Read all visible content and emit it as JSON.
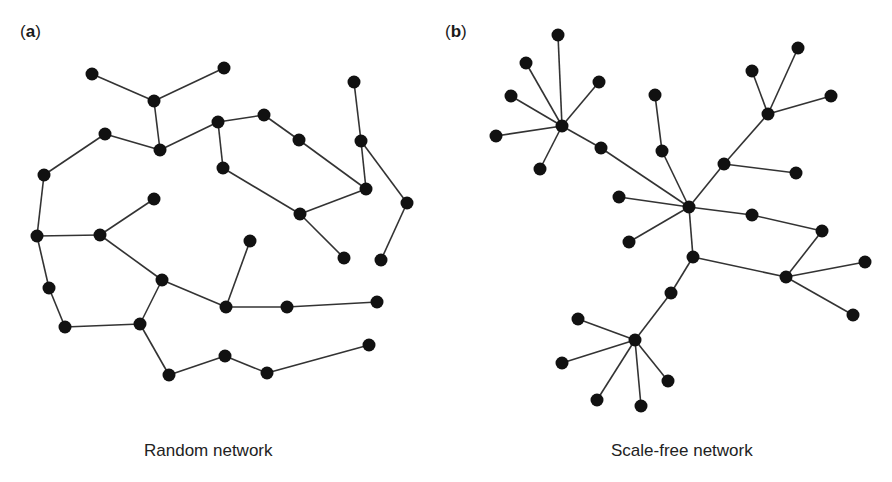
{
  "panels": [
    {
      "id": "a",
      "label_open": "(",
      "label_letter": "a",
      "label_close": ")",
      "caption": "Random network",
      "node_radius": 6.5,
      "nodes": [
        [
          92,
          74
        ],
        [
          154,
          101
        ],
        [
          224,
          68
        ],
        [
          160,
          150
        ],
        [
          105,
          134
        ],
        [
          44,
          175
        ],
        [
          37,
          236
        ],
        [
          100,
          235
        ],
        [
          154,
          199
        ],
        [
          218,
          122
        ],
        [
          264,
          115
        ],
        [
          299,
          140
        ],
        [
          223,
          168
        ],
        [
          354,
          82
        ],
        [
          361,
          141
        ],
        [
          366,
          189
        ],
        [
          407,
          203
        ],
        [
          300,
          214
        ],
        [
          344,
          258
        ],
        [
          381,
          260
        ],
        [
          250,
          241
        ],
        [
          162,
          280
        ],
        [
          226,
          307
        ],
        [
          287,
          307
        ],
        [
          377,
          302
        ],
        [
          49,
          288
        ],
        [
          65,
          327
        ],
        [
          140,
          324
        ],
        [
          169,
          375
        ],
        [
          225,
          356
        ],
        [
          267,
          373
        ],
        [
          369,
          345
        ]
      ],
      "edges": [
        [
          0,
          1
        ],
        [
          1,
          2
        ],
        [
          1,
          3
        ],
        [
          4,
          3
        ],
        [
          3,
          9
        ],
        [
          4,
          5
        ],
        [
          5,
          6
        ],
        [
          6,
          7
        ],
        [
          7,
          8
        ],
        [
          7,
          21
        ],
        [
          9,
          10
        ],
        [
          10,
          11
        ],
        [
          11,
          15
        ],
        [
          9,
          12
        ],
        [
          12,
          17
        ],
        [
          17,
          15
        ],
        [
          17,
          18
        ],
        [
          13,
          14
        ],
        [
          14,
          15
        ],
        [
          14,
          16
        ],
        [
          16,
          19
        ],
        [
          20,
          22
        ],
        [
          21,
          22
        ],
        [
          22,
          23
        ],
        [
          23,
          24
        ],
        [
          6,
          25
        ],
        [
          25,
          26
        ],
        [
          26,
          27
        ],
        [
          27,
          21
        ],
        [
          27,
          28
        ],
        [
          28,
          29
        ],
        [
          29,
          30
        ],
        [
          30,
          31
        ]
      ]
    },
    {
      "id": "b",
      "label_open": "(",
      "label_letter": "b",
      "label_close": ")",
      "caption": "Scale-free network",
      "node_radius": 6.5,
      "nodes": [
        [
          562,
          126
        ],
        [
          558,
          35
        ],
        [
          526,
          63
        ],
        [
          599,
          82
        ],
        [
          511,
          96
        ],
        [
          496,
          136
        ],
        [
          540,
          169
        ],
        [
          601,
          148
        ],
        [
          689,
          207
        ],
        [
          655,
          95
        ],
        [
          662,
          151
        ],
        [
          619,
          197
        ],
        [
          629,
          242
        ],
        [
          752,
          215
        ],
        [
          693,
          257
        ],
        [
          724,
          164
        ],
        [
          768,
          114
        ],
        [
          752,
          71
        ],
        [
          798,
          48
        ],
        [
          831,
          96
        ],
        [
          796,
          173
        ],
        [
          822,
          231
        ],
        [
          786,
          277
        ],
        [
          865,
          262
        ],
        [
          853,
          315
        ],
        [
          671,
          293
        ],
        [
          635,
          340
        ],
        [
          578,
          319
        ],
        [
          562,
          363
        ],
        [
          597,
          400
        ],
        [
          641,
          406
        ],
        [
          668,
          381
        ]
      ],
      "edges": [
        [
          0,
          1
        ],
        [
          0,
          2
        ],
        [
          0,
          3
        ],
        [
          0,
          4
        ],
        [
          0,
          5
        ],
        [
          0,
          6
        ],
        [
          0,
          7
        ],
        [
          7,
          8
        ],
        [
          9,
          10
        ],
        [
          10,
          8
        ],
        [
          8,
          11
        ],
        [
          8,
          12
        ],
        [
          8,
          13
        ],
        [
          8,
          14
        ],
        [
          8,
          15
        ],
        [
          15,
          16
        ],
        [
          16,
          17
        ],
        [
          16,
          18
        ],
        [
          16,
          19
        ],
        [
          15,
          20
        ],
        [
          13,
          21
        ],
        [
          21,
          22
        ],
        [
          14,
          22
        ],
        [
          22,
          23
        ],
        [
          22,
          24
        ],
        [
          14,
          25
        ],
        [
          25,
          26
        ],
        [
          26,
          27
        ],
        [
          26,
          28
        ],
        [
          26,
          29
        ],
        [
          26,
          30
        ],
        [
          26,
          31
        ]
      ]
    }
  ]
}
